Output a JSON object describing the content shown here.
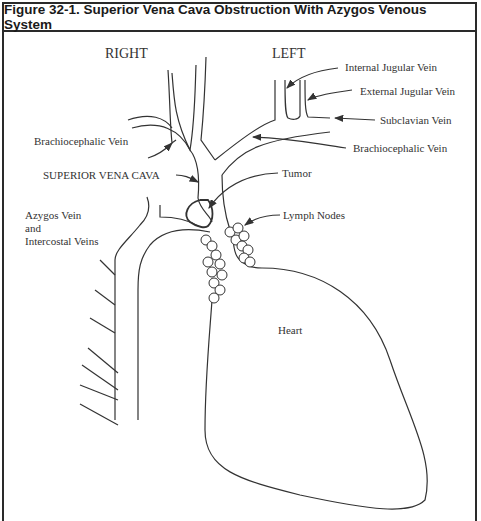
{
  "figure": {
    "title": "Figure 32-1. Superior Vena Cava Obstruction With Azygos Venous System"
  },
  "labels": {
    "right": "RIGHT",
    "left": "LEFT",
    "internal_jugular": "Internal Jugular Vein",
    "external_jugular": "External Jugular Vein",
    "subclavian": "Subclavian Vein",
    "brachiocephalic_left": "Brachiocephalic Vein",
    "brachiocephalic_right": "Brachiocephalic Vein",
    "svc": "SUPERIOR VENA CAVA",
    "tumor": "Tumor",
    "lymph_nodes": "Lymph Nodes",
    "azygos_line1": "Azygos Vein",
    "azygos_line2": "and",
    "azygos_line3": "Intercostal Veins",
    "heart": "Heart"
  },
  "colors": {
    "line": "#333333",
    "border": "#2a2a2a"
  }
}
